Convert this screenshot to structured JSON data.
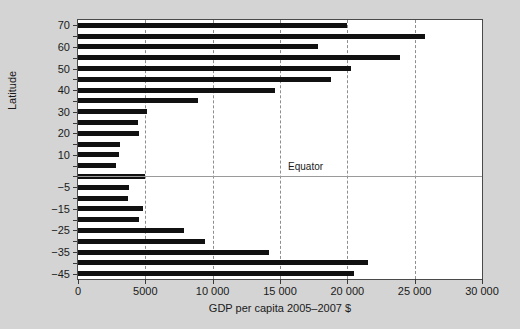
{
  "chart_data": {
    "type": "bar",
    "orientation": "horizontal",
    "title": "",
    "xlabel": "GDP per capita 2005–2007 $",
    "ylabel": "Latitude",
    "xlim": [
      0,
      30000
    ],
    "ylim": [
      -47.5,
      72.5
    ],
    "grid": "vertical-dashed",
    "legend": null,
    "xticks": [
      0,
      5000,
      10000,
      15000,
      20000,
      25000,
      30000
    ],
    "xticklabels": [
      "0",
      "5000",
      "10 000",
      "15 000",
      "20 000",
      "25 000",
      "30 000"
    ],
    "yticks": [
      70,
      60,
      50,
      40,
      30,
      20,
      10,
      -5,
      -15,
      -25,
      -35,
      -45
    ],
    "yticklabels": [
      "70",
      "60",
      "50",
      "40",
      "30",
      "20",
      "10",
      "−5",
      "−15",
      "−25",
      "−35",
      "−45"
    ],
    "annotations": [
      {
        "text": "Equator",
        "x": 15600,
        "y": 0,
        "kind": "horizontal-line-label"
      }
    ],
    "categories": [
      70,
      65,
      60,
      55,
      50,
      45,
      40,
      35,
      30,
      25,
      20,
      15,
      10,
      5,
      0,
      -5,
      -10,
      -15,
      -20,
      -25,
      -30,
      -35,
      -40,
      -45
    ],
    "values": [
      20000,
      25800,
      17800,
      23900,
      20300,
      18800,
      14600,
      8900,
      5100,
      4450,
      4550,
      3100,
      3050,
      2800,
      5000,
      3800,
      3700,
      4800,
      4500,
      7850,
      9450,
      14200,
      21500,
      20500
    ],
    "bar_color": "#111111",
    "plot_background": "#ffffff",
    "figure_background": "#d4d4d4"
  }
}
